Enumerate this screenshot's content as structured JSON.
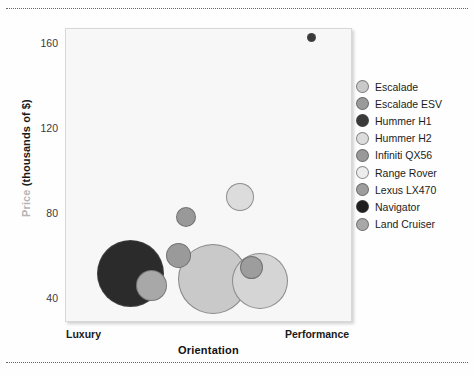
{
  "chart_data": {
    "type": "scatter",
    "title": "",
    "xlabel": "Orientation",
    "ylabel": "Price (thousands of $)",
    "ylabel_parts": {
      "soft": "Price",
      "hard": " (thousands of $)"
    },
    "x_endpoint_labels": {
      "left": "Luxury",
      "right": "Performance"
    },
    "yticks": [
      160,
      120,
      80,
      40
    ],
    "ylim": [
      28,
      173
    ],
    "xlim": [
      0,
      10
    ],
    "grid": false,
    "legend_position": "right",
    "series": [
      {
        "name": "Escalade",
        "x": 5.12,
        "y": 49,
        "size": 70,
        "color": "#c9c9c9"
      },
      {
        "name": "Escalade ESV",
        "x": 3.9,
        "y": 61,
        "size": 24,
        "color": "#9a9a9a"
      },
      {
        "name": "Hummer H1",
        "x": 8.54,
        "y": 161,
        "size": 9,
        "color": "#3a3a3a"
      },
      {
        "name": "Hummer H2",
        "x": 6.07,
        "y": 88,
        "size": 28,
        "color": "#dcdcdc"
      },
      {
        "name": "Infiniti QX56",
        "x": 4.18,
        "y": 79,
        "size": 20,
        "color": "#999999"
      },
      {
        "name": "Range Rover",
        "x": 6.76,
        "y": 48,
        "size": 56,
        "color": "#d5d5d5"
      },
      {
        "name": "Lexus LX470",
        "x": 6.45,
        "y": 55,
        "size": 22,
        "color": "#9d9d9d"
      },
      {
        "name": "Navigator",
        "x": 2.23,
        "y": 52,
        "size": 66,
        "color": "#2b2b2b"
      },
      {
        "name": "Land Cruiser",
        "x": 2.96,
        "y": 46,
        "size": 30,
        "color": "#a8a8a8"
      }
    ]
  },
  "legend": {
    "items": [
      {
        "label": "Escalade",
        "color": "#c9c9c9"
      },
      {
        "label": "Escalade ESV",
        "color": "#9a9a9a"
      },
      {
        "label": "Hummer H1",
        "color": "#3a3a3a"
      },
      {
        "label": "Hummer H2",
        "color": "#dcdcdc"
      },
      {
        "label": "Infiniti QX56",
        "color": "#999999"
      },
      {
        "label": "Range Rover",
        "color": "#ececec"
      },
      {
        "label": "Lexus LX470",
        "color": "#9d9d9d"
      },
      {
        "label": "Navigator",
        "color": "#1e1e1e"
      },
      {
        "label": "Land Cruiser",
        "color": "#a8a8a8"
      }
    ]
  },
  "bubble_geometry": [
    {
      "name": "Navigator",
      "cx": 129,
      "cy": 272,
      "r": 33.5,
      "color": "#2b2b2b"
    },
    {
      "name": "Escalade",
      "cx": 212,
      "cy": 278,
      "r": 35.0,
      "color": "#c9c9c9"
    },
    {
      "name": "Range Rover",
      "cx": 259,
      "cy": 280,
      "r": 28.0,
      "color": "#d5d5d5"
    },
    {
      "name": "Land Cruiser",
      "cx": 150,
      "cy": 284,
      "r": 15.5,
      "color": "#a8a8a8"
    },
    {
      "name": "Escalade ESV",
      "cx": 177,
      "cy": 254,
      "r": 12.5,
      "color": "#9a9a9a"
    },
    {
      "name": "Lexus LX470",
      "cx": 250,
      "cy": 266,
      "r": 11.5,
      "color": "#9d9d9d"
    },
    {
      "name": "Infiniti QX56",
      "cx": 185,
      "cy": 216,
      "r": 10.0,
      "color": "#999999"
    },
    {
      "name": "Hummer H2",
      "cx": 239,
      "cy": 196,
      "r": 14.0,
      "color": "#dcdcdc"
    },
    {
      "name": "Hummer H1",
      "cx": 310,
      "cy": 36,
      "r": 4.5,
      "color": "#3a3a3a"
    }
  ],
  "axis": {
    "yticks": [
      {
        "value": "160",
        "top": 43
      },
      {
        "value": "120",
        "top": 128
      },
      {
        "value": "80",
        "top": 213
      },
      {
        "value": "40",
        "top": 298
      }
    ]
  }
}
